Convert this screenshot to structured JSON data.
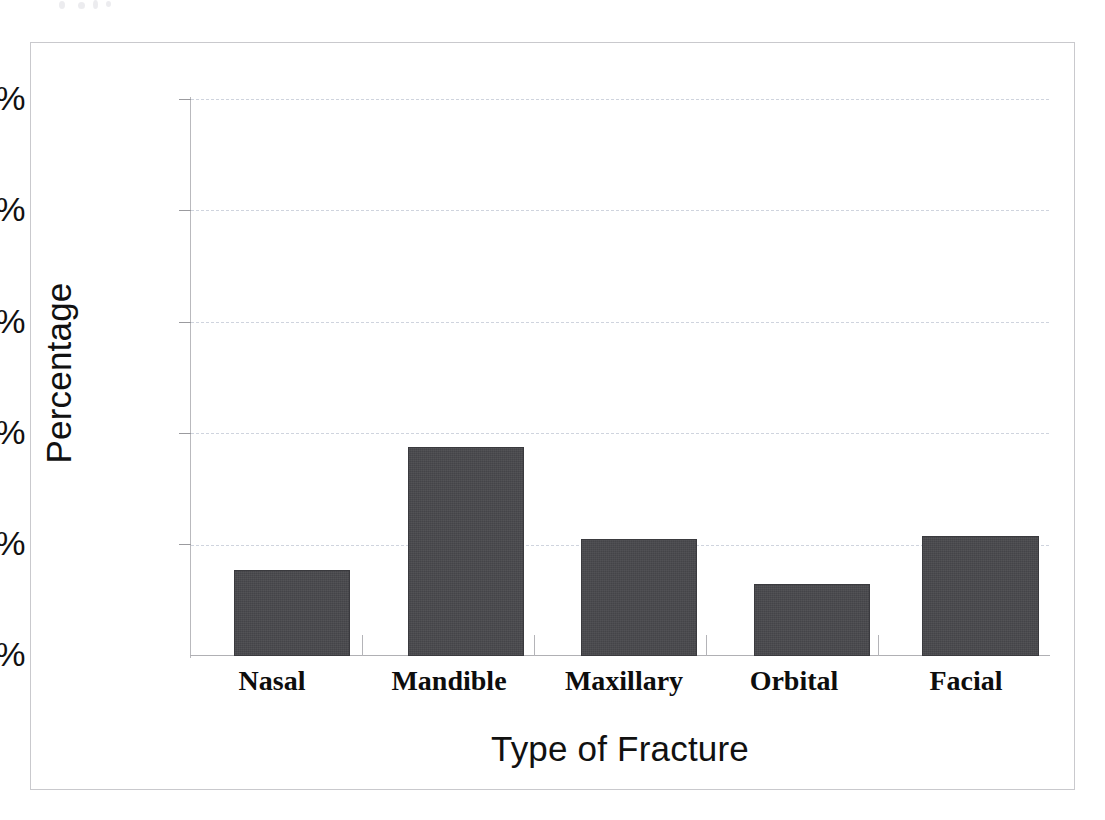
{
  "chart_data": {
    "type": "bar",
    "title": "",
    "subtitle": "",
    "xlabel": "Type of Fracture",
    "ylabel": "Percentage",
    "categories": [
      "Nasal",
      "Mandible",
      "Maxillary",
      "Orbital",
      "Facial"
    ],
    "values": [
      15.5,
      37.5,
      21.0,
      13.0,
      21.5
    ],
    "value_labels": [
      "",
      "",
      "",
      "",
      ""
    ],
    "ylim": [
      0,
      100
    ],
    "yticks": [
      0,
      20,
      40,
      60,
      80,
      100
    ],
    "ytick_labels": [
      "0%",
      "20%",
      "40%",
      "60%",
      "80%",
      "100%"
    ],
    "grid": "horizontal-dashed",
    "legend": "none",
    "legend_position": "",
    "series": [
      {
        "name": "Percentage",
        "values": [
          15.5,
          37.5,
          21.0,
          13.0,
          21.5
        ],
        "color": "#444448"
      }
    ],
    "annotations": []
  },
  "figure": {
    "frame_color": "#c9c9cd",
    "background": "#ffffff",
    "bar_color": "#444448",
    "grid_color": "#cfd4de",
    "axis_color": "#b0b0b4",
    "text_color": "#111111"
  }
}
